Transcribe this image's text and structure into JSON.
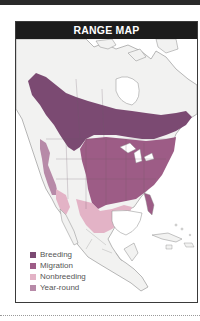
{
  "header": {
    "title": "RANGE MAP"
  },
  "legend": {
    "items": [
      {
        "label": "Breeding",
        "color": "#7b4a72"
      },
      {
        "label": "Migration",
        "color": "#9d5c86"
      },
      {
        "label": "Nonbreeding",
        "color": "#e3b3c6"
      },
      {
        "label": "Year-round",
        "color": "#b78aa8"
      }
    ]
  },
  "map": {
    "region": "North and Central America",
    "land_color": "#f2f2f1",
    "water_color": "#ffffff",
    "border_color": "#9a9a9a"
  }
}
